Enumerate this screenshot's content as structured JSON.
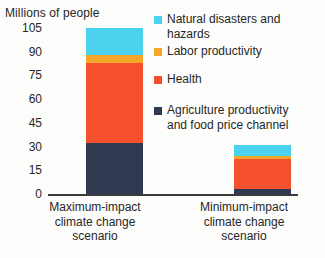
{
  "chart_data": {
    "type": "bar",
    "subtype": "stacked-column",
    "title": "",
    "ylabel": "Millions of people",
    "xlabel": "",
    "ylim": [
      0,
      105
    ],
    "yticks": [
      0,
      15,
      30,
      45,
      60,
      75,
      90,
      105
    ],
    "grid": false,
    "legend_position": "right",
    "categories": [
      "Maximum-impact climate change scenario",
      "Minimum-impact climate change scenario"
    ],
    "category_lines": [
      [
        "Maximum-impact",
        "climate change",
        "scenario"
      ],
      [
        "Minimum-impact",
        "climate change",
        "scenario"
      ]
    ],
    "series": [
      {
        "name": "Natural disasters and hazards",
        "name_lines": [
          "Natural disasters and",
          "hazards"
        ],
        "color": "#4ad2ee",
        "values": [
          17,
          7
        ]
      },
      {
        "name": "Labor productivity",
        "name_lines": [
          "Labor productivity"
        ],
        "color": "#f6a62a",
        "values": [
          5,
          2
        ]
      },
      {
        "name": "Health",
        "name_lines": [
          "Health"
        ],
        "color": "#f4502e",
        "values": [
          51,
          19
        ]
      },
      {
        "name": "Agriculture productivity and food price channel",
        "name_lines": [
          "Agriculture productivity",
          "and food price channel"
        ],
        "color": "#2f3950",
        "values": [
          32,
          3
        ]
      }
    ],
    "totals": [
      105,
      31
    ]
  }
}
